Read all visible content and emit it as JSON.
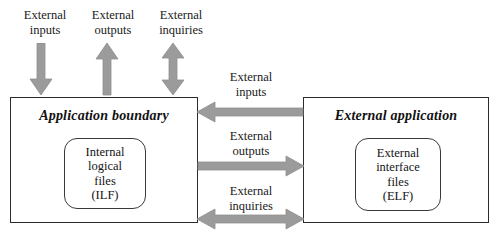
{
  "diagram": {
    "title_hidden": "",
    "accent_arrow_color": "#9b9b9b",
    "arrow_outline_color": "#8a8a8a",
    "box_border_color": "#2b2b2b",
    "text_color": "#1a1a1a",
    "background_color": "#ffffff"
  },
  "top_labels": [
    {
      "id": "external-inputs",
      "text": "External\ninputs"
    },
    {
      "id": "external-outputs",
      "text": "External\noutputs"
    },
    {
      "id": "external-inquiries",
      "text": "External\ninquiries"
    }
  ],
  "top_arrows": [
    {
      "id": "external-inputs-arrow",
      "direction": "down",
      "name": "arrow-down-external-inputs"
    },
    {
      "id": "external-outputs-arrow",
      "direction": "up",
      "name": "arrow-up-external-outputs"
    },
    {
      "id": "external-inquiries-arrow",
      "direction": "up-down",
      "name": "arrow-updown-external-inquiries"
    }
  ],
  "middle_labels": [
    {
      "id": "mid-external-inputs",
      "text": "External\ninputs"
    },
    {
      "id": "mid-external-outputs",
      "text": "External\noutputs"
    },
    {
      "id": "mid-external-inquiries",
      "text": "External\ninquiries"
    }
  ],
  "middle_arrows": [
    {
      "id": "mid-external-inputs-arrow",
      "direction": "left",
      "name": "arrow-left-external-inputs"
    },
    {
      "id": "mid-external-outputs-arrow",
      "direction": "right",
      "name": "arrow-right-external-outputs"
    },
    {
      "id": "mid-external-inquiries-arrow",
      "direction": "left-right",
      "name": "arrow-leftright-external-inquiries"
    }
  ],
  "application_boundary": {
    "title": "Application boundary",
    "inner": {
      "text": "Internal\nlogical\nfiles\n(ILF)"
    }
  },
  "external_application": {
    "title": "External application",
    "inner": {
      "text": "External\ninterface\nfiles\n(ELF)"
    }
  }
}
